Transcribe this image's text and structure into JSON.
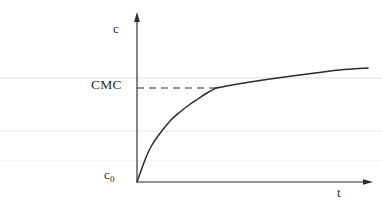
{
  "figure": {
    "background_color": "#ffffff",
    "ink_color": "#2b2b2b"
  },
  "labels": {
    "y_axis": "c",
    "x_axis": "t",
    "threshold": "CMC",
    "origin_value": "c",
    "origin_subscript": "0"
  },
  "chart_data": {
    "type": "line",
    "title": "",
    "xlabel": "t",
    "ylabel": "c",
    "grid": false,
    "legend": null,
    "annotations": [
      {
        "name": "cmc-threshold",
        "text": "CMC",
        "type": "horizontal-dashed-line",
        "y": 88,
        "x_start": 137,
        "x_end": 216
      },
      {
        "name": "initial-concentration",
        "text": "c0",
        "type": "axis-origin-label",
        "x": 137,
        "y": 182
      }
    ],
    "axes": {
      "x_axis_pixels": {
        "x_start": 137,
        "x_end": 372,
        "y": 182,
        "arrow": true
      },
      "y_axis_pixels": {
        "x": 137,
        "y_start": 182,
        "y_end": 14,
        "arrow": true
      }
    },
    "series": [
      {
        "name": "concentration",
        "style": "solid",
        "points": [
          [
            137,
            182
          ],
          [
            142,
            168
          ],
          [
            147,
            155
          ],
          [
            152,
            145
          ],
          [
            158,
            136
          ],
          [
            165,
            127
          ],
          [
            172,
            119
          ],
          [
            180,
            112
          ],
          [
            189,
            105
          ],
          [
            198,
            99
          ],
          [
            207,
            93
          ],
          [
            216,
            88
          ],
          [
            232,
            85
          ],
          [
            250,
            82
          ],
          [
            270,
            79
          ],
          [
            292,
            76
          ],
          [
            315,
            73
          ],
          [
            340,
            70
          ],
          [
            368,
            68
          ]
        ]
      }
    ]
  }
}
